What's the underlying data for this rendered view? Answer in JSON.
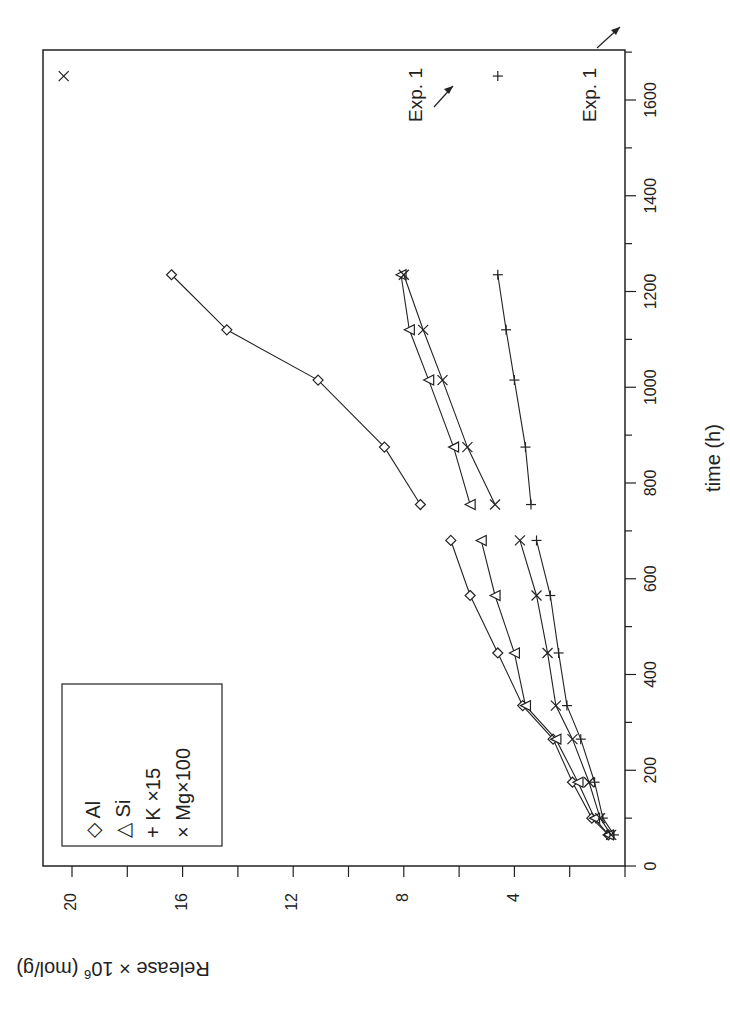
{
  "chart_data": {
    "type": "line",
    "orientation_note": "figure rotated 90 degrees clockwise in the image",
    "title": "",
    "xlabel": "time (h)",
    "ylabel": "Release × 10⁶ (mol/g)",
    "xlim": [
      0,
      1700
    ],
    "ylim": [
      0,
      21
    ],
    "x_ticks": [
      0,
      200,
      400,
      600,
      800,
      1000,
      1200,
      1400,
      1600
    ],
    "y_ticks": [
      4,
      8,
      12,
      16,
      20
    ],
    "legend": [
      "Al",
      "Si",
      "K ×15",
      "Mg×100"
    ],
    "legend_position": "upper left",
    "series": [
      {
        "name": "Al",
        "marker": "diamond",
        "segments": [
          {
            "x": [
              65,
              100,
              175,
              265,
              335,
              445,
              565,
              680
            ],
            "y": [
              0.6,
              1.2,
              1.9,
              2.6,
              3.7,
              4.6,
              5.6,
              6.3
            ]
          },
          {
            "x": [
              755,
              875,
              1015,
              1120,
              1235
            ],
            "y": [
              7.4,
              8.7,
              11.1,
              14.4,
              16.4
            ]
          }
        ]
      },
      {
        "name": "Si",
        "marker": "triangle",
        "segments": [
          {
            "x": [
              65,
              100,
              175,
              265,
              335,
              445,
              565,
              680
            ],
            "y": [
              0.6,
              1.1,
              1.7,
              2.5,
              3.6,
              4.0,
              4.7,
              5.2
            ]
          },
          {
            "x": [
              755,
              875,
              1015,
              1120,
              1235
            ],
            "y": [
              5.6,
              6.2,
              7.1,
              7.8,
              8.1
            ]
          }
        ]
      },
      {
        "name": "K ×15",
        "marker": "plus",
        "segments": [
          {
            "x": [
              65,
              100,
              175,
              265,
              335,
              445,
              565,
              680
            ],
            "y": [
              0.4,
              0.8,
              1.1,
              1.6,
              2.1,
              2.4,
              2.7,
              3.2
            ]
          },
          {
            "x": [
              755,
              875,
              1015,
              1120,
              1235
            ],
            "y": [
              3.4,
              3.6,
              4.0,
              4.3,
              4.6
            ]
          }
        ],
        "extra_points": [
          {
            "x": 1650,
            "y": 4.6,
            "label": "Exp. 1"
          }
        ]
      },
      {
        "name": "Mg×100",
        "marker": "x",
        "segments": [
          {
            "x": [
              65,
              100,
              175,
              265,
              335,
              445,
              565,
              680
            ],
            "y": [
              0.5,
              0.9,
              1.3,
              1.9,
              2.5,
              2.8,
              3.2,
              3.8
            ]
          },
          {
            "x": [
              755,
              875,
              1015,
              1120,
              1235
            ],
            "y": [
              4.7,
              5.7,
              6.6,
              7.3,
              8.0
            ]
          }
        ],
        "extra_points": [
          {
            "x": 1650,
            "y": 20.3,
            "label": "Exp. 1"
          }
        ]
      }
    ],
    "annotations": [
      {
        "text": "Exp. 1",
        "target_series": "Mg×100",
        "x": 1650,
        "y": 20.3
      },
      {
        "text": "Exp. 1",
        "target_series": "K ×15",
        "x": 1650,
        "y": 4.6
      }
    ]
  },
  "labels": {
    "xlabel": "time (h)",
    "ylabel_main": "Release × 10",
    "ylabel_sup": "6",
    "ylabel_unit": " (mol/g)",
    "x_tick_labels": [
      "0",
      "200",
      "400",
      "600",
      "800",
      "1000",
      "1200",
      "1400",
      "1600"
    ],
    "y_tick_labels": [
      "4",
      "8",
      "12",
      "16",
      "20"
    ],
    "legend": [
      {
        "symbol": "◇",
        "label": "Al"
      },
      {
        "symbol": "△",
        "label": "Si"
      },
      {
        "symbol": "+",
        "label": "K ×15"
      },
      {
        "symbol": "×",
        "label": "Mg×100"
      }
    ],
    "annotation_1": "Exp. 1",
    "annotation_2": "Exp. 1"
  }
}
